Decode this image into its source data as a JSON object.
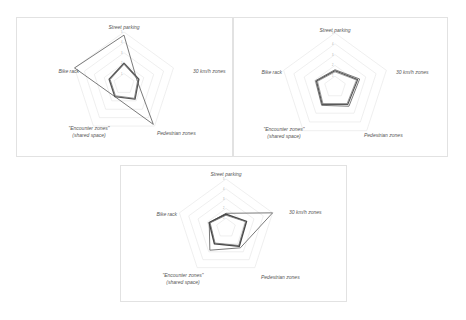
{
  "chart_data": [
    {
      "type": "radar",
      "title": "",
      "axes": [
        "Street parking",
        "30 km/h zones",
        "Pedestrian zones",
        "\"Encounter zones\" (shared space)",
        "Bike rack"
      ],
      "range": [
        0,
        5
      ],
      "grid": true,
      "rings": 5,
      "series": [
        {
          "name": "Series A",
          "values": [
            4.7,
            1.3,
            4.8,
            1.5,
            5.0
          ],
          "color": "#6b6b6b",
          "width": 0.9
        },
        {
          "name": "Series B",
          "values": [
            2.0,
            1.5,
            1.8,
            1.5,
            1.5
          ],
          "color": "#555555",
          "width": 1.4
        },
        {
          "name": "Series C",
          "values": [
            1.9,
            1.4,
            1.7,
            1.4,
            1.4
          ],
          "color": "#777777",
          "width": 0.8
        }
      ]
    },
    {
      "type": "radar",
      "title": "",
      "axes": [
        "Street parking",
        "30 km/h zones",
        "Pedestrian zones",
        "\"Encounter zones\" (shared space)",
        "Bike rack"
      ],
      "range": [
        0,
        5
      ],
      "grid": true,
      "rings": 5,
      "series": [
        {
          "name": "Series A",
          "values": [
            1.6,
            2.4,
            2.2,
            2.1,
            1.9
          ],
          "color": "#6b6b6b",
          "width": 0.9
        },
        {
          "name": "Series B",
          "values": [
            1.5,
            2.2,
            2.0,
            2.0,
            1.8
          ],
          "color": "#555555",
          "width": 1.2
        },
        {
          "name": "Series C",
          "values": [
            1.4,
            2.1,
            1.9,
            1.9,
            1.7
          ],
          "color": "#888888",
          "width": 0.8
        }
      ]
    },
    {
      "type": "radar",
      "title": "",
      "axes": [
        "Street parking",
        "30 km/h zones",
        "Pedestrian zones",
        "\"Encounter zones\" (shared space)",
        "Bike rack"
      ],
      "range": [
        0,
        5
      ],
      "grid": true,
      "rings": 5,
      "series": [
        {
          "name": "Series A",
          "values": [
            1.5,
            5.0,
            2.5,
            2.8,
            1.8
          ],
          "color": "#6b6b6b",
          "width": 0.9
        },
        {
          "name": "Series B",
          "values": [
            1.4,
            2.2,
            2.3,
            2.0,
            1.8
          ],
          "color": "#444444",
          "width": 1.5
        },
        {
          "name": "Series C",
          "values": [
            1.3,
            2.1,
            2.2,
            1.9,
            1.7
          ],
          "color": "#777777",
          "width": 0.8
        }
      ]
    }
  ],
  "panels": [
    {
      "labels": {
        "top": "Street parking",
        "right": "30 km/h zones",
        "bottom_right": "Pedestrian zones",
        "bottom_left_1": "\"Encounter zones\"",
        "bottom_left_2": "(shared space)",
        "left": "Bike rack"
      }
    },
    {
      "labels": {
        "top": "Street parking",
        "right": "30 km/h zones",
        "bottom_right": "Pedestrian zones",
        "bottom_left_1": "\"Encounter zones\"",
        "bottom_left_2": "(shared space)",
        "left": "Bike rack"
      }
    },
    {
      "labels": {
        "top": "Street parking",
        "right": "30 km/h zones",
        "bottom_right": "Pedestrian zones",
        "bottom_left_1": "\"Encounter zones\"",
        "bottom_left_2": "(shared space)",
        "left": "Bike rack"
      }
    }
  ]
}
